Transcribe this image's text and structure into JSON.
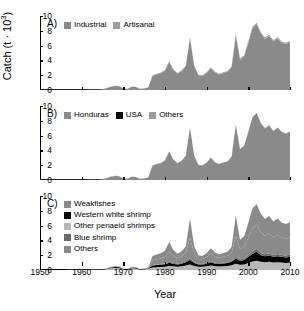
{
  "figure": {
    "x_axis_title": "Year",
    "y_axis_title_main": "Catch (t · 10",
    "y_axis_title_sup": "3",
    "y_axis_title_close": ")",
    "x_ticks": [
      "1950",
      "1960",
      "1970",
      "1980",
      "1990",
      "2000",
      "2010"
    ],
    "y_ticks": [
      "10",
      "8",
      "6",
      "4",
      "2",
      "0"
    ],
    "colors": {
      "medium_gray": "#8a8a8a",
      "light_gray": "#b8b8b8",
      "dark_gray": "#6a6a6a",
      "black": "#000000",
      "axis": "#000000"
    }
  },
  "panels": [
    {
      "label": "A)",
      "legend": [
        {
          "name": "Industrial",
          "color": "#8a8a8a"
        },
        {
          "name": "Artisanal",
          "color": "#9e9e9e"
        }
      ]
    },
    {
      "label": "B)",
      "legend": [
        {
          "name": "Honduras",
          "color": "#8a8a8a"
        },
        {
          "name": "USA",
          "color": "#000000"
        },
        {
          "name": "Others",
          "color": "#9e9e9e"
        }
      ]
    },
    {
      "label": "C)",
      "legend": [
        {
          "name": "Weakfishes",
          "color": "#8a8a8a"
        },
        {
          "name": "Western white shrimp",
          "color": "#000000"
        },
        {
          "name": "Other penaeid shrimps",
          "color": "#b8b8b8"
        },
        {
          "name": "Blue shrimp",
          "color": "#6a6a6a"
        },
        {
          "name": "Others",
          "color": "#8a8a8a"
        }
      ]
    }
  ],
  "chart_data": {
    "type": "area",
    "title": "",
    "xlabel": "Year",
    "ylabel": "Catch (t · 10^3)",
    "xlim": [
      1950,
      2010
    ],
    "ylim": [
      0,
      10
    ],
    "grid": false,
    "legend_position": "inside-top-left",
    "x": [
      1950,
      1951,
      1952,
      1953,
      1954,
      1955,
      1956,
      1957,
      1958,
      1959,
      1960,
      1961,
      1962,
      1963,
      1964,
      1965,
      1966,
      1967,
      1968,
      1969,
      1970,
      1971,
      1972,
      1973,
      1974,
      1975,
      1976,
      1977,
      1978,
      1979,
      1980,
      1981,
      1982,
      1983,
      1984,
      1985,
      1986,
      1987,
      1988,
      1989,
      1990,
      1991,
      1992,
      1993,
      1994,
      1995,
      1996,
      1997,
      1998,
      1999,
      2000,
      2001,
      2002,
      2003,
      2004,
      2005,
      2006,
      2007,
      2008,
      2009,
      2010
    ],
    "panels": [
      {
        "panel": "A",
        "label": "A)",
        "series": [
          {
            "name": "Industrial",
            "color": "#8a8a8a",
            "values": [
              0.02,
              0.02,
              0.02,
              0.02,
              0.02,
              0.03,
              0.03,
              0.03,
              0.04,
              0.04,
              0.05,
              0.05,
              0.06,
              0.06,
              0.07,
              0.1,
              0.25,
              0.45,
              0.55,
              0.5,
              0.2,
              0.15,
              0.45,
              0.4,
              0.15,
              0.2,
              0.35,
              1.9,
              2.1,
              2.25,
              2.6,
              3.8,
              2.7,
              2.2,
              2.55,
              3.2,
              7.0,
              3.2,
              2.0,
              1.9,
              2.3,
              2.95,
              2.35,
              2.1,
              2.3,
              2.45,
              3.1,
              7.4,
              4.1,
              4.55,
              6.4,
              8.35,
              8.9,
              7.6,
              6.9,
              7.3,
              6.55,
              6.95,
              6.4,
              6.2,
              6.45
            ]
          },
          {
            "name": "Artisanal",
            "color": "#9e9e9e",
            "values": [
              0.0,
              0.0,
              0.0,
              0.0,
              0.0,
              0.0,
              0.0,
              0.0,
              0.0,
              0.0,
              0.0,
              0.0,
              0.0,
              0.0,
              0.0,
              0.0,
              0.02,
              0.03,
              0.04,
              0.04,
              0.02,
              0.02,
              0.03,
              0.03,
              0.02,
              0.02,
              0.03,
              0.08,
              0.09,
              0.1,
              0.1,
              0.12,
              0.11,
              0.1,
              0.11,
              0.12,
              0.15,
              0.12,
              0.1,
              0.1,
              0.11,
              0.12,
              0.11,
              0.1,
              0.11,
              0.11,
              0.12,
              0.16,
              0.14,
              0.15,
              0.18,
              0.2,
              0.2,
              0.19,
              0.18,
              0.18,
              0.17,
              0.18,
              0.17,
              0.17,
              0.17
            ]
          }
        ]
      },
      {
        "panel": "B",
        "label": "B)",
        "series": [
          {
            "name": "Honduras",
            "color": "#8a8a8a",
            "values": [
              0.02,
              0.02,
              0.02,
              0.02,
              0.02,
              0.03,
              0.03,
              0.03,
              0.04,
              0.04,
              0.05,
              0.05,
              0.06,
              0.06,
              0.07,
              0.1,
              0.25,
              0.45,
              0.55,
              0.5,
              0.2,
              0.15,
              0.45,
              0.4,
              0.15,
              0.2,
              0.35,
              1.9,
              2.1,
              2.25,
              2.6,
              3.8,
              2.7,
              2.2,
              2.55,
              3.2,
              7.0,
              3.2,
              2.0,
              1.9,
              2.3,
              2.95,
              2.35,
              2.1,
              2.3,
              2.45,
              3.1,
              7.4,
              4.1,
              4.55,
              6.4,
              8.35,
              8.9,
              7.6,
              6.9,
              7.3,
              6.55,
              6.95,
              6.4,
              6.2,
              6.45
            ]
          },
          {
            "name": "USA",
            "color": "#000000",
            "values": [
              0.0,
              0.0,
              0.0,
              0.0,
              0.0,
              0.0,
              0.0,
              0.0,
              0.0,
              0.0,
              0.0,
              0.0,
              0.0,
              0.0,
              0.0,
              0.0,
              0.0,
              0.0,
              0.0,
              0.0,
              0.0,
              0.0,
              0.0,
              0.0,
              0.0,
              0.0,
              0.0,
              0.02,
              0.02,
              0.02,
              0.02,
              0.03,
              0.02,
              0.02,
              0.02,
              0.03,
              0.04,
              0.03,
              0.02,
              0.02,
              0.02,
              0.03,
              0.02,
              0.02,
              0.02,
              0.02,
              0.03,
              0.04,
              0.03,
              0.03,
              0.04,
              0.05,
              0.05,
              0.04,
              0.04,
              0.04,
              0.04,
              0.04,
              0.04,
              0.03,
              0.03
            ]
          },
          {
            "name": "Others",
            "color": "#9e9e9e",
            "values": [
              0.0,
              0.0,
              0.0,
              0.0,
              0.0,
              0.0,
              0.0,
              0.0,
              0.0,
              0.0,
              0.0,
              0.0,
              0.0,
              0.0,
              0.0,
              0.0,
              0.01,
              0.01,
              0.01,
              0.01,
              0.01,
              0.01,
              0.01,
              0.01,
              0.01,
              0.01,
              0.01,
              0.04,
              0.04,
              0.04,
              0.05,
              0.06,
              0.05,
              0.04,
              0.05,
              0.06,
              0.08,
              0.06,
              0.05,
              0.05,
              0.05,
              0.06,
              0.05,
              0.05,
              0.05,
              0.05,
              0.06,
              0.08,
              0.07,
              0.07,
              0.09,
              0.1,
              0.1,
              0.09,
              0.09,
              0.09,
              0.08,
              0.09,
              0.08,
              0.08,
              0.08
            ]
          }
        ]
      },
      {
        "panel": "C",
        "label": "C)",
        "series": [
          {
            "name": "Other penaeid shrimps",
            "color": "#b8b8b8",
            "values": [
              0.01,
              0.01,
              0.01,
              0.01,
              0.01,
              0.01,
              0.01,
              0.02,
              0.02,
              0.02,
              0.02,
              0.02,
              0.03,
              0.03,
              0.03,
              0.05,
              0.12,
              0.22,
              0.27,
              0.25,
              0.1,
              0.07,
              0.22,
              0.2,
              0.07,
              0.1,
              0.17,
              0.35,
              0.38,
              0.4,
              0.45,
              0.55,
              0.5,
              0.45,
              0.5,
              0.6,
              0.75,
              0.55,
              0.45,
              0.45,
              0.5,
              0.6,
              0.5,
              0.48,
              0.52,
              0.55,
              0.65,
              0.85,
              0.7,
              0.75,
              0.95,
              1.15,
              1.25,
              1.1,
              1.05,
              1.1,
              1.0,
              1.05,
              1.0,
              0.95,
              1.0
            ]
          },
          {
            "name": "Western white shrimp",
            "color": "#000000",
            "values": [
              0.01,
              0.01,
              0.01,
              0.01,
              0.01,
              0.01,
              0.01,
              0.01,
              0.01,
              0.01,
              0.02,
              0.02,
              0.02,
              0.02,
              0.02,
              0.03,
              0.06,
              0.1,
              0.12,
              0.11,
              0.05,
              0.04,
              0.1,
              0.09,
              0.04,
              0.05,
              0.08,
              0.25,
              0.28,
              0.3,
              0.33,
              0.42,
              0.35,
              0.3,
              0.35,
              0.45,
              0.6,
              0.4,
              0.3,
              0.3,
              0.35,
              0.45,
              0.35,
              0.32,
              0.36,
              0.38,
              0.45,
              0.7,
              0.55,
              0.6,
              0.8,
              1.05,
              1.2,
              0.9,
              0.8,
              0.85,
              0.78,
              0.82,
              0.78,
              0.75,
              0.8
            ]
          },
          {
            "name": "Blue shrimp",
            "color": "#6a6a6a",
            "values": [
              0.0,
              0.0,
              0.0,
              0.0,
              0.0,
              0.0,
              0.0,
              0.0,
              0.0,
              0.0,
              0.0,
              0.0,
              0.0,
              0.0,
              0.0,
              0.01,
              0.02,
              0.03,
              0.04,
              0.04,
              0.02,
              0.01,
              0.03,
              0.03,
              0.01,
              0.02,
              0.03,
              0.08,
              0.09,
              0.1,
              0.11,
              0.14,
              0.12,
              0.1,
              0.12,
              0.15,
              0.2,
              0.14,
              0.1,
              0.1,
              0.12,
              0.15,
              0.12,
              0.11,
              0.12,
              0.13,
              0.15,
              0.24,
              0.18,
              0.2,
              0.27,
              0.35,
              0.4,
              0.3,
              0.28,
              0.29,
              0.26,
              0.28,
              0.26,
              0.25,
              0.27
            ]
          },
          {
            "name": "Weakfishes",
            "color": "#8a8a8a",
            "values": [
              0.0,
              0.0,
              0.0,
              0.0,
              0.0,
              0.0,
              0.0,
              0.0,
              0.01,
              0.01,
              0.01,
              0.01,
              0.01,
              0.01,
              0.01,
              0.01,
              0.03,
              0.07,
              0.08,
              0.07,
              0.02,
              0.02,
              0.07,
              0.06,
              0.02,
              0.02,
              0.05,
              0.6,
              0.7,
              0.75,
              0.9,
              1.4,
              0.95,
              0.75,
              0.9,
              1.15,
              2.8,
              1.15,
              0.65,
              0.6,
              0.8,
              1.05,
              0.8,
              0.7,
              0.8,
              0.85,
              1.1,
              2.8,
              1.4,
              1.6,
              2.3,
              3.1,
              3.3,
              2.8,
              2.5,
              2.7,
              2.4,
              2.55,
              2.35,
              2.25,
              2.35
            ]
          },
          {
            "name": "Others",
            "color": "#8a8a8a",
            "values": [
              0.0,
              0.0,
              0.0,
              0.0,
              0.0,
              0.0,
              0.0,
              0.0,
              0.0,
              0.0,
              0.0,
              0.0,
              0.0,
              0.0,
              0.01,
              0.0,
              0.02,
              0.03,
              0.04,
              0.03,
              0.01,
              0.01,
              0.03,
              0.02,
              0.01,
              0.01,
              0.02,
              0.62,
              0.65,
              0.7,
              0.81,
              1.29,
              0.78,
              0.6,
              0.68,
              0.85,
              2.65,
              0.96,
              0.5,
              0.45,
              0.53,
              0.7,
              0.58,
              0.49,
              0.5,
              0.54,
              0.8,
              2.81,
              1.27,
              1.4,
              2.08,
              2.7,
              2.75,
              2.5,
              2.27,
              2.37,
              2.13,
              2.25,
              2.03,
              2.0,
              2.03
            ]
          }
        ]
      }
    ]
  }
}
